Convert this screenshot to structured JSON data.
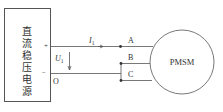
{
  "diagram": {
    "source_box": {
      "label_chars": [
        "直",
        "流",
        "稳",
        "压",
        "电",
        "源"
      ],
      "plus_label": "+",
      "minus_label": "−"
    },
    "current_label": {
      "main": "I",
      "sub": "1"
    },
    "voltage_label": {
      "main": "U",
      "sub": "1"
    },
    "node_o_label": "O",
    "terminals": [
      {
        "id": "A",
        "label": "A"
      },
      {
        "id": "B",
        "label": "B"
      },
      {
        "id": "C",
        "label": "C"
      }
    ],
    "motor": {
      "label": "PMSM"
    },
    "colors": {
      "line": "#555555",
      "text": "#333333",
      "background": "#ffffff"
    }
  }
}
